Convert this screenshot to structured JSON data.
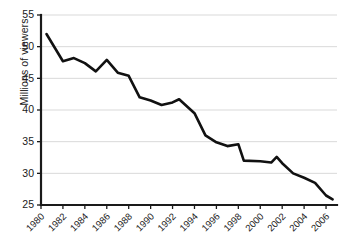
{
  "chart_data": {
    "type": "line",
    "title": "",
    "subtitle": "",
    "xlabel": "",
    "ylabel": "Millions of viewers",
    "xlim": [
      1980,
      2007
    ],
    "ylim": [
      25,
      55
    ],
    "ytick_values": [
      25,
      30,
      35,
      40,
      45,
      50,
      55
    ],
    "ytick_labels": [
      "25",
      "30",
      "35",
      "40",
      "45",
      "50",
      "55"
    ],
    "xtick_values": [
      1980,
      1982,
      1984,
      1986,
      1988,
      1990,
      1992,
      1994,
      1996,
      1998,
      2000,
      2002,
      2004,
      2006
    ],
    "xtick_labels": [
      "1980",
      "1982",
      "1984",
      "1986",
      "1988",
      "1990",
      "1992",
      "1994",
      "1996",
      "1998",
      "2000",
      "2002",
      "2004",
      "2006"
    ],
    "grid": "horizontal",
    "legend": "none",
    "line_color": "#111111",
    "grid_color": "#d9d9d9",
    "axis_color": "#1a1a1a",
    "x": [
      1980.5,
      1982,
      1983,
      1984,
      1985,
      1986,
      1987,
      1988,
      1989,
      1990,
      1991,
      1992,
      1992.6,
      1994,
      1995,
      1996,
      1997,
      1998,
      1998.5,
      2000,
      2001,
      2001.5,
      2002,
      2003,
      2004,
      2005,
      2006,
      2006.6
    ],
    "values": [
      52.0,
      47.7,
      48.2,
      47.4,
      46.1,
      47.9,
      45.9,
      45.4,
      42.0,
      41.5,
      40.8,
      41.2,
      41.7,
      39.5,
      36.0,
      34.9,
      34.3,
      34.6,
      32.0,
      31.9,
      31.7,
      32.6,
      31.6,
      30.0,
      29.3,
      28.5,
      26.5,
      25.9
    ],
    "series": [
      {
        "name": "Millions of viewers",
        "points": [
          {
            "x": 1980.5,
            "y": 52.0
          },
          {
            "x": 1982.0,
            "y": 47.7
          },
          {
            "x": 1983.0,
            "y": 48.2
          },
          {
            "x": 1984.0,
            "y": 47.4
          },
          {
            "x": 1985.0,
            "y": 46.1
          },
          {
            "x": 1986.0,
            "y": 47.9
          },
          {
            "x": 1987.0,
            "y": 45.9
          },
          {
            "x": 1988.0,
            "y": 45.4
          },
          {
            "x": 1989.0,
            "y": 42.0
          },
          {
            "x": 1990.0,
            "y": 41.5
          },
          {
            "x": 1991.0,
            "y": 40.8
          },
          {
            "x": 1992.0,
            "y": 41.2
          },
          {
            "x": 1992.6,
            "y": 41.7
          },
          {
            "x": 1994.0,
            "y": 39.5
          },
          {
            "x": 1995.0,
            "y": 36.0
          },
          {
            "x": 1996.0,
            "y": 34.9
          },
          {
            "x": 1997.0,
            "y": 34.3
          },
          {
            "x": 1998.0,
            "y": 34.6
          },
          {
            "x": 1998.5,
            "y": 32.0
          },
          {
            "x": 2000.0,
            "y": 31.9
          },
          {
            "x": 2001.0,
            "y": 31.7
          },
          {
            "x": 2001.5,
            "y": 32.6
          },
          {
            "x": 2002.0,
            "y": 31.6
          },
          {
            "x": 2003.0,
            "y": 30.0
          },
          {
            "x": 2004.0,
            "y": 29.3
          },
          {
            "x": 2005.0,
            "y": 28.5
          },
          {
            "x": 2006.0,
            "y": 26.5
          },
          {
            "x": 2006.6,
            "y": 25.9
          }
        ]
      }
    ]
  }
}
